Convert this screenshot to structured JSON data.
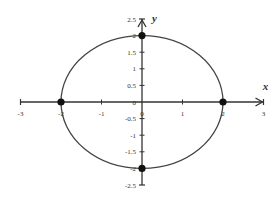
{
  "chart_data": {
    "type": "line",
    "title": "",
    "xlabel": "x",
    "ylabel": "y",
    "xlim": [
      -3,
      3
    ],
    "ylim": [
      -2.5,
      2.5
    ],
    "grid": false,
    "legend": null,
    "x_ticks": [
      "-3",
      "-2",
      "-1",
      "0",
      "1",
      "2",
      "3"
    ],
    "y_ticks": [
      "2.5",
      "2",
      "1.5",
      "1",
      "0.5",
      "0",
      "-0.5",
      "-1",
      "-1.5",
      "-2",
      "-2.5"
    ],
    "series": [
      {
        "name": "ellipse",
        "shape": "ellipse",
        "center": [
          0,
          0
        ],
        "rx": 2,
        "ry": 2,
        "equation": "x^2/4 + y^2/4 = 1"
      }
    ],
    "points": [
      {
        "x": -2,
        "y": 0
      },
      {
        "x": 2,
        "y": 0
      },
      {
        "x": 0,
        "y": 2
      },
      {
        "x": 0,
        "y": -2
      }
    ]
  },
  "colors": {
    "axis": "#333333",
    "curve": "#444444",
    "point": "#111111"
  }
}
